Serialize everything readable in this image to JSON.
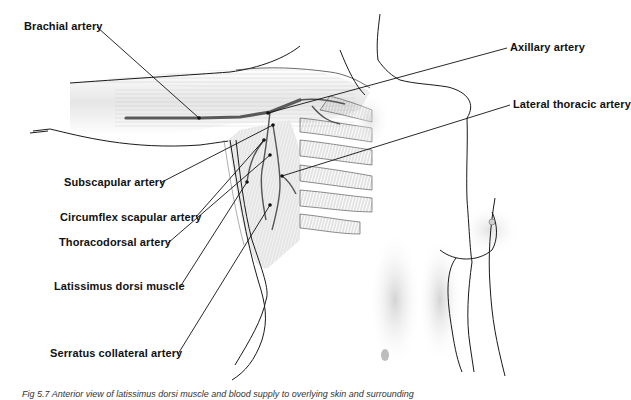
{
  "figure": {
    "title": "Anterior view of latissimus dorsi muscle and blood supply",
    "caption": "Fig 5.7 Anterior view of latissimus dorsi muscle and blood supply to overlying skin and surrounding",
    "colors": {
      "background": "#ffffff",
      "outline": "#1a1a1a",
      "artery": "#555555",
      "brachial_artery": "#5a5a5a",
      "muscle_fiber": "#9a9a9a",
      "shading": "#d8d8d8",
      "leader_line": "#111111",
      "label_text": "#111111"
    },
    "labels": [
      {
        "id": "brachial-artery",
        "text": "Brachial artery",
        "x": 24,
        "y": 20,
        "anchor": [
          97,
          27
        ],
        "target": [
          199,
          118
        ]
      },
      {
        "id": "axillary-artery",
        "text": "Axillary artery",
        "x": 510,
        "y": 41,
        "anchor": [
          507,
          48
        ],
        "target": [
          268,
          113
        ]
      },
      {
        "id": "lateral-thoracic-artery",
        "text": "Lateral thoracic artery",
        "x": 513,
        "y": 98,
        "anchor": [
          510,
          105
        ],
        "target": [
          282,
          176
        ]
      },
      {
        "id": "subscapular-artery",
        "text": "Subscapular artery",
        "x": 64,
        "y": 176,
        "anchor": [
          160,
          183
        ],
        "target": [
          273,
          125
        ]
      },
      {
        "id": "circumflex-scapular-artery",
        "text": "Circumflex scapular artery",
        "x": 60,
        "y": 211,
        "anchor": [
          196,
          217
        ],
        "target": [
          264,
          140
        ]
      },
      {
        "id": "thoracodorsal-artery",
        "text": "Thoracodorsal artery",
        "x": 59,
        "y": 236,
        "anchor": [
          168,
          243
        ],
        "target": [
          270,
          155
        ]
      },
      {
        "id": "latissimus-dorsi-muscle",
        "text": "Latissimus dorsi muscle",
        "x": 54,
        "y": 280,
        "anchor": [
          180,
          287
        ],
        "target": [
          247,
          182
        ]
      },
      {
        "id": "serratus-collateral-artery",
        "text": "Serratus collateral artery",
        "x": 50,
        "y": 347,
        "anchor": [
          178,
          354
        ],
        "target": [
          270,
          205
        ]
      }
    ]
  }
}
